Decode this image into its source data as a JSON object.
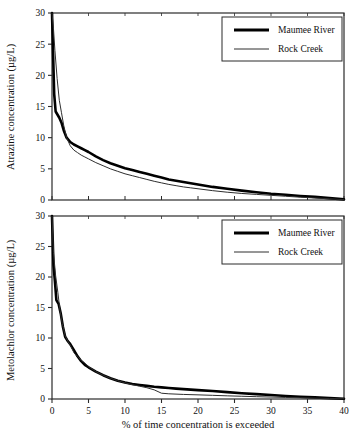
{
  "figure": {
    "background_color": "#ffffff",
    "foreground_color": "#000000"
  },
  "xlabel": "% of time concentration is exceeded",
  "legend": {
    "entries": [
      {
        "label": "Maumee River",
        "style": "thick-solid-line",
        "color": "#000000"
      },
      {
        "label": "Rock Creek",
        "style": "thin-solid-line",
        "color": "#2e2e2e"
      }
    ]
  },
  "chart_data": [
    {
      "type": "line",
      "title": "",
      "panel": "top",
      "xlabel": "% of time concentration is exceeded",
      "ylabel": "Atrazine concentration (µg/L)",
      "xlim": [
        0,
        40
      ],
      "ylim": [
        0,
        30
      ],
      "xticks": [
        0,
        5,
        10,
        15,
        20,
        25,
        30,
        35,
        40
      ],
      "yticks": [
        0,
        5,
        10,
        15,
        20,
        25,
        30
      ],
      "grid": false,
      "legend_position": "top-right",
      "series": [
        {
          "name": "Maumee River",
          "x": [
            0.0,
            0.15,
            0.3,
            0.5,
            0.8,
            1.0,
            1.3,
            1.6,
            2.0,
            2.5,
            3.0,
            3.5,
            4.0,
            4.5,
            5.0,
            6.0,
            7.0,
            8.0,
            9.0,
            10.0,
            11.0,
            12.0,
            13.0,
            14.0,
            15.0,
            16.0,
            17.0,
            18.0,
            19.0,
            20.0,
            22.0,
            24.0,
            26.0,
            28.0,
            30.0,
            32.0,
            34.0,
            36.0,
            38.0,
            40.0
          ],
          "y": [
            30.0,
            23.5,
            17.0,
            14.2,
            13.6,
            13.2,
            12.4,
            11.2,
            10.0,
            9.3,
            8.9,
            8.6,
            8.3,
            8.0,
            7.7,
            7.0,
            6.4,
            5.9,
            5.5,
            5.1,
            4.8,
            4.5,
            4.2,
            3.9,
            3.6,
            3.3,
            3.1,
            2.9,
            2.7,
            2.5,
            2.1,
            1.8,
            1.5,
            1.25,
            1.0,
            0.85,
            0.65,
            0.5,
            0.3,
            0.1
          ]
        },
        {
          "name": "Rock Creek",
          "x": [
            0.0,
            0.2,
            0.4,
            0.7,
            1.0,
            1.3,
            1.6,
            2.0,
            2.5,
            3.0,
            3.5,
            4.0,
            4.5,
            5.0,
            6.0,
            7.0,
            8.0,
            9.0,
            10.0,
            11.0,
            12.0,
            13.0,
            14.0,
            15.0,
            16.0,
            17.0,
            18.0,
            19.0,
            20.0,
            22.0,
            24.0,
            26.0,
            28.0,
            30.0,
            32.0,
            34.0,
            36.0,
            38.0,
            40.0
          ],
          "y": [
            30.0,
            27.5,
            24.0,
            19.5,
            16.0,
            14.0,
            12.0,
            10.0,
            8.7,
            8.0,
            7.6,
            7.2,
            6.9,
            6.6,
            6.0,
            5.5,
            5.0,
            4.6,
            4.2,
            3.9,
            3.6,
            3.3,
            3.0,
            2.75,
            2.5,
            2.3,
            2.1,
            1.95,
            1.8,
            1.5,
            1.25,
            1.05,
            0.9,
            0.75,
            0.6,
            0.45,
            0.32,
            0.2,
            0.05
          ]
        }
      ]
    },
    {
      "type": "line",
      "title": "",
      "panel": "bottom",
      "xlabel": "% of time concentration is exceeded",
      "ylabel": "Metolachlor concentration (µg/L)",
      "xlim": [
        0,
        40
      ],
      "ylim": [
        0,
        30
      ],
      "xticks": [
        0,
        5,
        10,
        15,
        20,
        25,
        30,
        35,
        40
      ],
      "yticks": [
        0,
        5,
        10,
        15,
        20,
        25,
        30
      ],
      "grid": false,
      "legend_position": "top-right",
      "series": [
        {
          "name": "Maumee River",
          "x": [
            0.0,
            0.2,
            0.4,
            0.6,
            0.9,
            1.2,
            1.5,
            1.8,
            2.1,
            2.5,
            3.0,
            3.5,
            4.0,
            4.5,
            5.0,
            6.0,
            7.0,
            8.0,
            9.0,
            10.0,
            11.0,
            12.0,
            13.0,
            14.0,
            15.0,
            16.0,
            17.0,
            18.0,
            20.0,
            22.0,
            24.0,
            26.0,
            28.0,
            30.0,
            32.0,
            34.0,
            36.0,
            38.0,
            40.0
          ],
          "y": [
            30.0,
            22.0,
            19.3,
            16.2,
            15.6,
            14.0,
            11.8,
            10.2,
            9.6,
            9.0,
            8.0,
            7.0,
            6.2,
            5.6,
            5.2,
            4.5,
            3.9,
            3.4,
            3.0,
            2.7,
            2.45,
            2.3,
            2.15,
            2.0,
            1.9,
            1.8,
            1.7,
            1.62,
            1.45,
            1.3,
            1.12,
            0.95,
            0.8,
            0.65,
            0.5,
            0.38,
            0.26,
            0.15,
            0.05
          ]
        },
        {
          "name": "Rock Creek",
          "x": [
            0.0,
            0.2,
            0.5,
            0.8,
            1.1,
            1.4,
            1.8,
            2.2,
            2.6,
            3.0,
            3.3,
            3.6,
            4.0,
            4.4,
            5.0,
            6.0,
            7.0,
            8.0,
            9.0,
            10.0,
            11.0,
            12.0,
            13.0,
            14.0,
            15.0,
            16.0,
            18.0,
            20.0,
            22.0,
            24.0,
            26.0,
            28.0,
            30.0,
            32.0,
            34.0,
            36.0,
            38.0,
            40.0
          ],
          "y": [
            30.0,
            24.0,
            20.2,
            17.5,
            14.5,
            12.4,
            10.4,
            9.4,
            8.6,
            7.6,
            7.2,
            6.9,
            6.3,
            6.0,
            5.3,
            4.5,
            3.9,
            3.4,
            3.0,
            2.65,
            2.35,
            2.1,
            1.85,
            1.5,
            0.95,
            0.85,
            0.75,
            0.68,
            0.6,
            0.52,
            0.45,
            0.38,
            0.32,
            0.26,
            0.2,
            0.14,
            0.09,
            0.04
          ]
        }
      ]
    }
  ]
}
